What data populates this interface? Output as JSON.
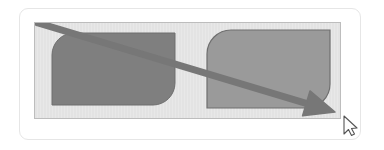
{
  "scene": {
    "kind": "drawing-canvas-screenshot",
    "width": 384,
    "height": 150
  },
  "card": {
    "background_color": "#ffffff",
    "border_color": "#e6e6e6",
    "corner_radius": 9,
    "x": 19,
    "y": 8,
    "width": 342,
    "height": 132
  },
  "panel": {
    "background_color": "#e3e3e3",
    "border_color": "#bdbdbd",
    "x": 34,
    "y": 22,
    "width": 307,
    "height": 97
  },
  "shapes": [
    {
      "name": "left-rounded-rect",
      "fill_color": "#7f7f7f",
      "stroke_color": "#6e6e6e",
      "x": 52,
      "y": 33,
      "width": 123,
      "height": 72,
      "corner_radius_top_left": 22,
      "corner_radius_top_right": 0,
      "corner_radius_bottom_right": 22,
      "corner_radius_bottom_left": 0
    },
    {
      "name": "right-rounded-rect",
      "fill_color": "#9a9a9a",
      "stroke_color": "#6f6f6f",
      "x": 207,
      "y": 30,
      "width": 123,
      "height": 78,
      "corner_radius_top_left": 24,
      "corner_radius_top_right": 0,
      "corner_radius_bottom_right": 24,
      "corner_radius_bottom_left": 0
    }
  ],
  "arrow": {
    "name": "diagonal-arrow",
    "color": "#777777",
    "stroke_width": 7,
    "start_x": 38,
    "start_y": 23,
    "end_x": 335,
    "end_y": 112,
    "head_length": 30,
    "head_width": 26
  },
  "cursor": {
    "name": "mouse-pointer",
    "fill_color": "#fdfdfd",
    "outline_color": "#555555",
    "x": 344,
    "y": 116
  },
  "labels": {
    "canvas_title": "",
    "status_text": ""
  }
}
